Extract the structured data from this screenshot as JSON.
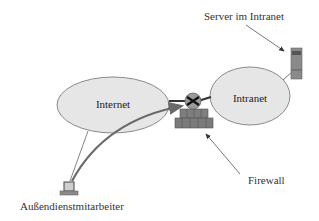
{
  "diagram": {
    "nodes": {
      "internet": {
        "label": "Internet"
      },
      "intranet": {
        "label": "Intranet"
      },
      "server": {
        "label": "Server im Intranet"
      },
      "firewall": {
        "label": "Firewall"
      },
      "remote_worker": {
        "label": "Außendienstmitarbeiter"
      }
    },
    "edges": [
      {
        "from": "internet",
        "to": "firewall",
        "style": "thick-line"
      },
      {
        "from": "firewall",
        "to": "intranet",
        "style": "thick-line"
      },
      {
        "from": "intranet",
        "to": "server",
        "style": "thin-line"
      },
      {
        "from": "remote_worker",
        "to": "internet",
        "style": "thin-line"
      },
      {
        "from": "remote_worker",
        "to": "firewall",
        "style": "curved-tunnel-arrow"
      }
    ],
    "annotations": [
      {
        "label_ref": "server",
        "points_to": "server",
        "style": "arrow"
      },
      {
        "label_ref": "firewall",
        "points_to": "firewall",
        "style": "arrow"
      }
    ]
  },
  "colors": {
    "cloud_fill": "#e6e6e6",
    "cloud_stroke": "#8a8a8a",
    "brick": "#7a7a7a",
    "device": "#8c8c8c",
    "line": "#555555"
  }
}
